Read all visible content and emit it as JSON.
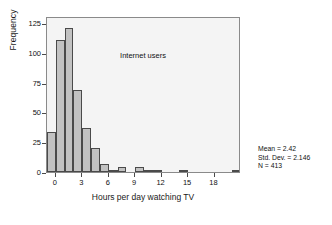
{
  "chart_data": {
    "type": "bar",
    "title": "",
    "plot_note": "Internet users",
    "xlabel": "Hours per day watching TV",
    "ylabel": "Frequency",
    "xlim": [
      -1,
      21
    ],
    "ylim": [
      0,
      131
    ],
    "grid": false,
    "legend": "none",
    "bin_width": 1,
    "xticks": [
      0,
      3,
      6,
      9,
      12,
      15,
      18
    ],
    "xtick_labels": [
      "0",
      "3",
      "6",
      "9",
      "12",
      "15",
      "18"
    ],
    "yticks": [
      0,
      25,
      50,
      75,
      100,
      125
    ],
    "ytick_labels": [
      "0",
      "25",
      "50",
      "75",
      "100",
      "125"
    ],
    "bin_starts": [
      -1,
      0,
      1,
      2,
      3,
      4,
      5,
      6,
      7,
      8,
      9,
      10,
      11,
      12,
      14,
      20
    ],
    "values": [
      34,
      111,
      121,
      69,
      37,
      20,
      7,
      2,
      4,
      0,
      4,
      1,
      2,
      0,
      1,
      1
    ],
    "bars": [
      {
        "x0": -1,
        "x1": 0,
        "value": 34
      },
      {
        "x0": 0,
        "x1": 1,
        "value": 111
      },
      {
        "x0": 1,
        "x1": 2,
        "value": 121
      },
      {
        "x0": 2,
        "x1": 3,
        "value": 69
      },
      {
        "x0": 3,
        "x1": 4,
        "value": 37
      },
      {
        "x0": 4,
        "x1": 5,
        "value": 20
      },
      {
        "x0": 5,
        "x1": 6,
        "value": 7
      },
      {
        "x0": 6,
        "x1": 7,
        "value": 2
      },
      {
        "x0": 7,
        "x1": 8,
        "value": 4
      },
      {
        "x0": 9,
        "x1": 10,
        "value": 4
      },
      {
        "x0": 10,
        "x1": 11,
        "value": 1
      },
      {
        "x0": 11,
        "x1": 12,
        "value": 2
      },
      {
        "x0": 14,
        "x1": 15,
        "value": 1
      },
      {
        "x0": 20,
        "x1": 21,
        "value": 1
      }
    ],
    "bar_fill": "#c2c2c2",
    "bar_edge": "#4a4a4a",
    "plot_background": "#f4f4f4",
    "frame_color": "#8a8a8a"
  },
  "stats": {
    "mean": "Mean = 2.42",
    "std_dev": "Std. Dev. = 2.146",
    "n": "N = 413"
  }
}
